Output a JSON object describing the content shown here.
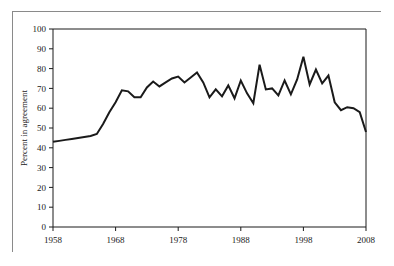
{
  "chart_data": {
    "type": "line",
    "title": "",
    "xlabel": "",
    "ylabel": "Percent in agreement",
    "xlim": [
      1958,
      2008
    ],
    "ylim": [
      0,
      100
    ],
    "grid": false,
    "legend": null,
    "xticks": [
      1958,
      1968,
      1978,
      1988,
      1998,
      2008
    ],
    "yticks": [
      0,
      10,
      20,
      30,
      40,
      50,
      60,
      70,
      80,
      90,
      100
    ],
    "series": [
      {
        "name": "Percent in agreement",
        "color": "#1a1a1a",
        "x": [
          1958,
          1959,
          1960,
          1961,
          1962,
          1963,
          1964,
          1965,
          1966,
          1967,
          1968,
          1969,
          1970,
          1971,
          1972,
          1973,
          1974,
          1975,
          1976,
          1977,
          1978,
          1979,
          1980,
          1981,
          1982,
          1983,
          1984,
          1985,
          1986,
          1987,
          1988,
          1989,
          1990,
          1991,
          1992,
          1993,
          1994,
          1995,
          1996,
          1997,
          1998,
          1999,
          2000,
          2001,
          2002,
          2003,
          2004,
          2005,
          2006,
          2007,
          2008
        ],
        "values": [
          43.0,
          43.5,
          44.0,
          44.5,
          45.0,
          45.5,
          46.0,
          47.0,
          52.0,
          58.0,
          63.0,
          69.0,
          68.5,
          65.5,
          65.5,
          70.5,
          73.5,
          71.0,
          73.0,
          75.0,
          76.0,
          73.0,
          75.5,
          78.0,
          73.0,
          65.5,
          69.5,
          66.0,
          71.5,
          65.0,
          74.0,
          67.5,
          62.5,
          82.0,
          69.5,
          70.0,
          66.5,
          74.0,
          67.0,
          74.5,
          86.0,
          72.0,
          79.5,
          72.5,
          76.5,
          63.0,
          59.0,
          60.5,
          60.0,
          58.0,
          48.0
        ]
      }
    ],
    "annotations": []
  },
  "axis": {
    "y_title": "Percent in agreement",
    "y_labels": [
      "100",
      "90",
      "80",
      "70",
      "60",
      "50",
      "40",
      "30",
      "20",
      "10",
      "0"
    ],
    "x_labels": [
      "1958",
      "1968",
      "1978",
      "1988",
      "1998",
      "2008"
    ]
  },
  "style": {
    "line_color": "#1a1a1a",
    "axis_color": "#1a1a1a",
    "frame_color": "#8a8a8a",
    "background": "#ffffff"
  }
}
